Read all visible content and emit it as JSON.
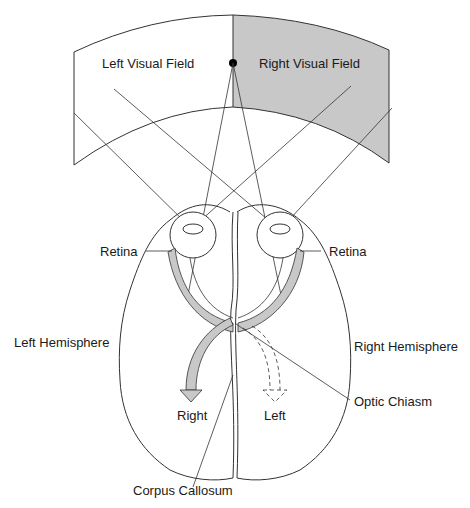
{
  "diagram": {
    "labels": {
      "left_visual_field": "Left Visual Field",
      "right_visual_field": "Right Visual Field",
      "retina_left": "Retina",
      "retina_right": "Retina",
      "left_hemisphere": "Left Hemisphere",
      "right_hemisphere": "Right Hemisphere",
      "right_arrow": "Right",
      "left_arrow": "Left",
      "optic_chiasm": "Optic Chiasm",
      "corpus_callosum": "Corpus Callosum"
    },
    "colors": {
      "right_field_fill": "#c8c8c8",
      "pathway_fill": "#c8c8c8",
      "line": "#333333"
    }
  }
}
